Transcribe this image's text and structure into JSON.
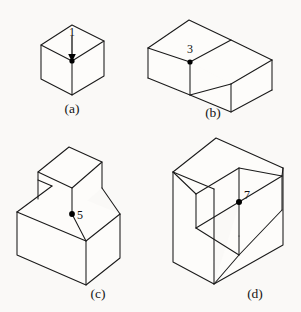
{
  "plate": {
    "title": "Isometric solid figures with marked vertices",
    "background_color": "#faf9f7",
    "line_color": "#1a1a1a",
    "figure_count": 4
  },
  "figures": [
    {
      "id": "a",
      "caption": "(a)",
      "name": "cube",
      "vertex_label": "1",
      "has_arrow": true,
      "marked_vertex": "top-front-center"
    },
    {
      "id": "b",
      "caption": "(b)",
      "name": "l-shaped-block",
      "vertex_label": "3",
      "has_arrow": false,
      "marked_vertex": "inner-notch-top"
    },
    {
      "id": "c",
      "caption": "(c)",
      "name": "stepped-block",
      "vertex_label": "5",
      "has_arrow": false,
      "marked_vertex": "step-front-corner"
    },
    {
      "id": "d",
      "caption": "(d)",
      "name": "notched-cube",
      "vertex_label": "7",
      "has_arrow": false,
      "marked_vertex": "inner-corner"
    }
  ],
  "labels": {
    "caption_a": "(a)",
    "caption_b": "(b)",
    "caption_c": "(c)",
    "caption_d": "(d)",
    "vertex_1": "1",
    "vertex_3": "3",
    "vertex_5": "5",
    "vertex_7": "7"
  }
}
